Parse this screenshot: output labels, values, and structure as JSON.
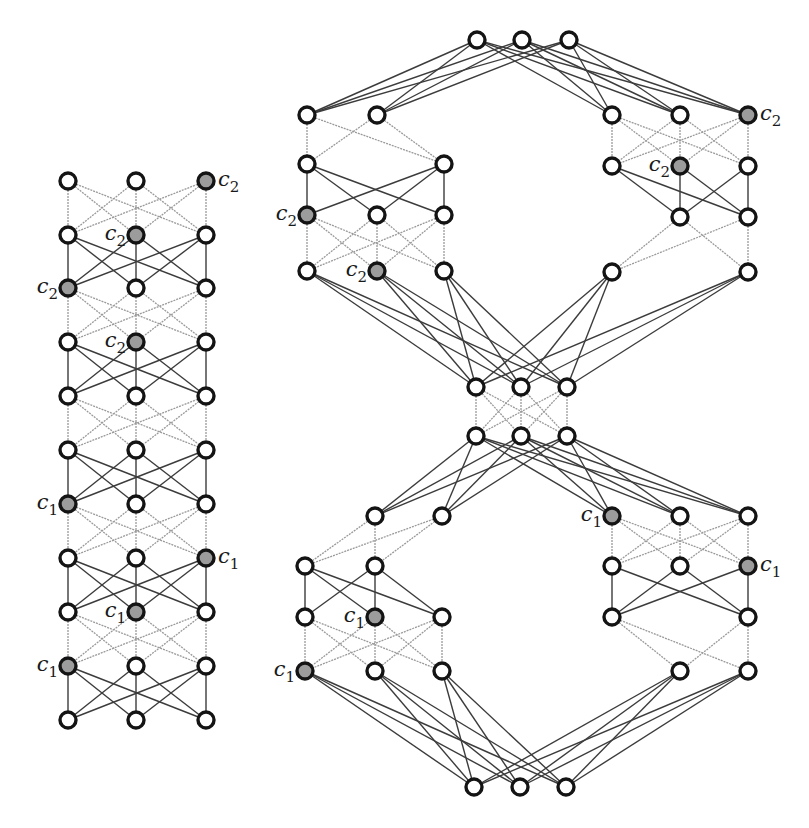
{
  "figure": {
    "colors": {
      "node_stroke": "#141414",
      "node_open_fill": "#ffffff",
      "node_filled": "#9c9c9c",
      "edge_light": "#9a9a9a",
      "edge_dark": "#3c3c3c",
      "label": "#1a1a1a"
    },
    "node_radius": 8
  },
  "left_graph": {
    "name": "left-layered-graph",
    "columns_x": [
      68,
      136,
      206
    ],
    "rows_y": [
      181,
      235,
      288,
      342,
      396,
      450,
      504,
      558,
      612,
      666,
      720
    ],
    "layer_styles": [
      "light",
      "dark",
      "light",
      "dark",
      "light",
      "dark",
      "light",
      "dark",
      "light",
      "dark"
    ],
    "marked_nodes": [
      {
        "row": 0,
        "col": 2,
        "label": "c",
        "sub": "2",
        "side": "right"
      },
      {
        "row": 1,
        "col": 1,
        "label": "c",
        "sub": "2",
        "side": "left"
      },
      {
        "row": 2,
        "col": 0,
        "label": "c",
        "sub": "2",
        "side": "left"
      },
      {
        "row": 3,
        "col": 1,
        "label": "c",
        "sub": "2",
        "side": "left"
      },
      {
        "row": 6,
        "col": 0,
        "label": "c",
        "sub": "1",
        "side": "left"
      },
      {
        "row": 7,
        "col": 2,
        "label": "c",
        "sub": "1",
        "side": "right"
      },
      {
        "row": 8,
        "col": 1,
        "label": "c",
        "sub": "1",
        "side": "left"
      },
      {
        "row": 9,
        "col": 0,
        "label": "c",
        "sub": "1",
        "side": "left"
      }
    ]
  },
  "right_graph": {
    "name": "right-hourglass-graph",
    "nodes": [
      {
        "id": "T0",
        "x": 477,
        "y": 40
      },
      {
        "id": "T1",
        "x": 522,
        "y": 40
      },
      {
        "id": "T2",
        "x": 569,
        "y": 40
      },
      {
        "id": "A1a",
        "x": 307,
        "y": 115
      },
      {
        "id": "A1b",
        "x": 377,
        "y": 115
      },
      {
        "id": "A2a",
        "x": 307,
        "y": 164
      },
      {
        "id": "A2b",
        "x": 444,
        "y": 164
      },
      {
        "id": "A3a",
        "x": 307,
        "y": 215,
        "filled": true,
        "label": "c",
        "sub": "2",
        "side": "left"
      },
      {
        "id": "A3b",
        "x": 377,
        "y": 215
      },
      {
        "id": "A3c",
        "x": 444,
        "y": 215
      },
      {
        "id": "A4a",
        "x": 307,
        "y": 271
      },
      {
        "id": "A4b",
        "x": 377,
        "y": 271,
        "filled": true,
        "label": "c",
        "sub": "2",
        "side": "left"
      },
      {
        "id": "A4c",
        "x": 444,
        "y": 271
      },
      {
        "id": "B1a",
        "x": 612,
        "y": 115
      },
      {
        "id": "B1b",
        "x": 680,
        "y": 115
      },
      {
        "id": "B1c",
        "x": 748,
        "y": 115,
        "filled": true,
        "label": "c",
        "sub": "2",
        "side": "right"
      },
      {
        "id": "B2a",
        "x": 612,
        "y": 166
      },
      {
        "id": "B2b",
        "x": 680,
        "y": 166,
        "filled": true,
        "label": "c",
        "sub": "2",
        "side": "left"
      },
      {
        "id": "B2c",
        "x": 748,
        "y": 166
      },
      {
        "id": "B3b",
        "x": 680,
        "y": 217
      },
      {
        "id": "B3c",
        "x": 748,
        "y": 217
      },
      {
        "id": "B4a",
        "x": 612,
        "y": 272
      },
      {
        "id": "B4c",
        "x": 748,
        "y": 272
      },
      {
        "id": "M0",
        "x": 476,
        "y": 387
      },
      {
        "id": "M1",
        "x": 521,
        "y": 387
      },
      {
        "id": "M2",
        "x": 567,
        "y": 387
      },
      {
        "id": "N0",
        "x": 476,
        "y": 436
      },
      {
        "id": "N1",
        "x": 521,
        "y": 436
      },
      {
        "id": "N2",
        "x": 567,
        "y": 436
      },
      {
        "id": "C5b",
        "x": 375,
        "y": 516
      },
      {
        "id": "C5c",
        "x": 442,
        "y": 516
      },
      {
        "id": "C6a",
        "x": 305,
        "y": 566
      },
      {
        "id": "C6b",
        "x": 375,
        "y": 566
      },
      {
        "id": "C7a",
        "x": 305,
        "y": 617
      },
      {
        "id": "C7b",
        "x": 375,
        "y": 617,
        "filled": true,
        "label": "c",
        "sub": "1",
        "side": "left"
      },
      {
        "id": "C7c",
        "x": 442,
        "y": 617
      },
      {
        "id": "C8a",
        "x": 305,
        "y": 671,
        "filled": true,
        "label": "c",
        "sub": "1",
        "side": "left"
      },
      {
        "id": "C8b",
        "x": 375,
        "y": 671
      },
      {
        "id": "C8c",
        "x": 442,
        "y": 671
      },
      {
        "id": "D5a",
        "x": 612,
        "y": 516,
        "filled": true,
        "label": "c",
        "sub": "1",
        "side": "left"
      },
      {
        "id": "D5b",
        "x": 680,
        "y": 516
      },
      {
        "id": "D5c",
        "x": 748,
        "y": 516
      },
      {
        "id": "D6a",
        "x": 612,
        "y": 566
      },
      {
        "id": "D6b",
        "x": 680,
        "y": 566
      },
      {
        "id": "D6c",
        "x": 748,
        "y": 566,
        "filled": true,
        "label": "c",
        "sub": "1",
        "side": "right"
      },
      {
        "id": "D7a",
        "x": 612,
        "y": 617
      },
      {
        "id": "D7c",
        "x": 748,
        "y": 617
      },
      {
        "id": "D8b",
        "x": 680,
        "y": 671
      },
      {
        "id": "D8c",
        "x": 748,
        "y": 671
      },
      {
        "id": "Z0",
        "x": 474,
        "y": 787
      },
      {
        "id": "Z1",
        "x": 520,
        "y": 787
      },
      {
        "id": "Z2",
        "x": 566,
        "y": 787
      }
    ],
    "edge_groups": [
      {
        "style": "dark",
        "from": [
          "T0",
          "T1",
          "T2"
        ],
        "to": [
          "A1a",
          "A1b",
          "B1a",
          "B1b",
          "B1c"
        ]
      },
      {
        "style": "light",
        "from": [
          "A1a",
          "A1b"
        ],
        "to": [
          "A2a",
          "A2b"
        ]
      },
      {
        "style": "dark",
        "from": [
          "A2a",
          "A2b"
        ],
        "to": [
          "A3a",
          "A3b",
          "A3c"
        ]
      },
      {
        "style": "light",
        "from": [
          "A3a",
          "A3b",
          "A3c"
        ],
        "to": [
          "A4a",
          "A4b",
          "A4c"
        ]
      },
      {
        "style": "light",
        "from": [
          "B1a",
          "B1b",
          "B1c"
        ],
        "to": [
          "B2a",
          "B2b",
          "B2c"
        ]
      },
      {
        "style": "dark",
        "from": [
          "B2a",
          "B2b",
          "B2c"
        ],
        "to": [
          "B3b",
          "B3c"
        ]
      },
      {
        "style": "light",
        "from": [
          "B3b",
          "B3c"
        ],
        "to": [
          "B4a",
          "B4c"
        ]
      },
      {
        "style": "dark",
        "from": [
          "A4a",
          "A4b",
          "A4c",
          "B4a",
          "B4c"
        ],
        "to": [
          "M0",
          "M1",
          "M2"
        ]
      },
      {
        "style": "light",
        "from": [
          "M0",
          "M1",
          "M2"
        ],
        "to": [
          "N0",
          "N1",
          "N2"
        ]
      },
      {
        "style": "dark",
        "from": [
          "N0",
          "N1",
          "N2"
        ],
        "to": [
          "C5b",
          "C5c",
          "D5a",
          "D5b",
          "D5c"
        ]
      },
      {
        "style": "light",
        "from": [
          "C5b",
          "C5c"
        ],
        "to": [
          "C6a",
          "C6b"
        ]
      },
      {
        "style": "dark",
        "from": [
          "C6a",
          "C6b"
        ],
        "to": [
          "C7a",
          "C7b",
          "C7c"
        ]
      },
      {
        "style": "light",
        "from": [
          "C7a",
          "C7b",
          "C7c"
        ],
        "to": [
          "C8a",
          "C8b",
          "C8c"
        ]
      },
      {
        "style": "light",
        "from": [
          "D5a",
          "D5b",
          "D5c"
        ],
        "to": [
          "D6a",
          "D6b",
          "D6c"
        ]
      },
      {
        "style": "dark",
        "from": [
          "D6a",
          "D6b",
          "D6c"
        ],
        "to": [
          "D7a",
          "D7c"
        ]
      },
      {
        "style": "light",
        "from": [
          "D7a",
          "D7c"
        ],
        "to": [
          "D8b",
          "D8c"
        ]
      },
      {
        "style": "dark",
        "from": [
          "C8a",
          "C8b",
          "C8c",
          "D8b",
          "D8c"
        ],
        "to": [
          "Z0",
          "Z1",
          "Z2"
        ]
      }
    ]
  }
}
